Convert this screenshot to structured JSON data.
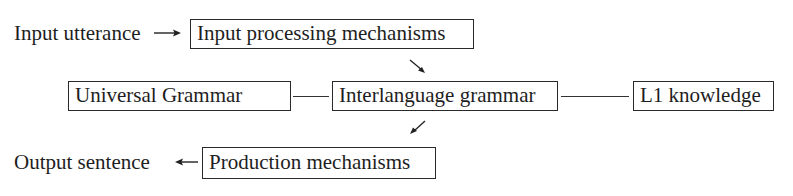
{
  "diagram": {
    "input_label": "Input utterance",
    "output_label": "Output sentence",
    "nodes": {
      "input_processing": "Input processing mechanisms",
      "universal_grammar": "Universal Grammar",
      "interlanguage_grammar": "Interlanguage grammar",
      "l1_knowledge": "L1 knowledge",
      "production": "Production mechanisms"
    },
    "edges": [
      {
        "from": "Input utterance",
        "to": "Input processing mechanisms",
        "type": "arrow"
      },
      {
        "from": "Input processing mechanisms",
        "to": "Interlanguage grammar",
        "type": "arrow"
      },
      {
        "from": "Universal Grammar",
        "to": "Interlanguage grammar",
        "type": "line"
      },
      {
        "from": "Interlanguage grammar",
        "to": "L1 knowledge",
        "type": "line"
      },
      {
        "from": "Interlanguage grammar",
        "to": "Production mechanisms",
        "type": "arrow"
      },
      {
        "from": "Production mechanisms",
        "to": "Output sentence",
        "type": "arrow"
      }
    ]
  }
}
